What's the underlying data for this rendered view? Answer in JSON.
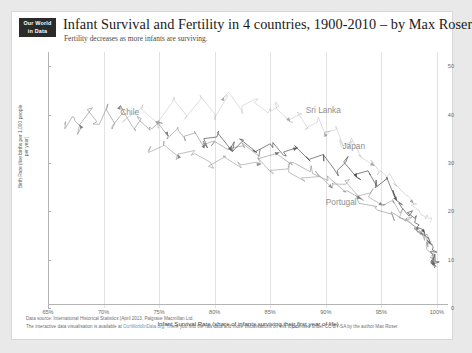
{
  "header": {
    "logo_line1": "Our World",
    "logo_line2": "in Data",
    "title": "Infant Survival and Fertility in 4 countries, 1900-2010 – by Max Roser",
    "subtitle": "Fertility decreases as more infants are surviving."
  },
  "footer": {
    "source": "Data source:  International Historical Statistics (April 2013, Palgrave Macmillan Ltd.",
    "interactive_pre": "The interactive data visualisation is available at ",
    "interactive_link": "OurWorldInData.org",
    "interactive_post": ". There you find the raw data and more visualisations on this topic.",
    "license": "Licensed under CC-BY-SA by the author Max Roser"
  },
  "chart_data": {
    "type": "line",
    "title": "Infant Survival and Fertility in 4 countries, 1900-2010",
    "subtitle": "Fertility decreases as more infants are surviving.",
    "xlabel": "Infant Survival Rate (share of infants surviving their first year of life)",
    "ylabel": "Birth Rate (live births per 1,000 people per year)",
    "xlim": [
      65,
      101
    ],
    "ylim": [
      0,
      53
    ],
    "grid": "vertical",
    "legend_position": "inline-annotations",
    "xticks": [
      "65%",
      "70%",
      "75%",
      "80%",
      "85%",
      "90%",
      "95%",
      "100%"
    ],
    "xtick_values": [
      65,
      70,
      75,
      80,
      85,
      90,
      95,
      100
    ],
    "yticks": [
      "0",
      "10",
      "20",
      "30",
      "40",
      "50"
    ],
    "ytick_values": [
      0,
      10,
      20,
      30,
      40,
      50
    ],
    "annotations": [
      {
        "text": "Chile",
        "x": 71.5,
        "y": 40.5
      },
      {
        "text": "Sri Lanka",
        "x": 88.2,
        "y": 41.0
      },
      {
        "text": "Japan",
        "x": 91.5,
        "y": 33.5
      },
      {
        "text": "Portugal",
        "x": 90.0,
        "y": 22.0
      }
    ],
    "series": [
      {
        "name": "Chile",
        "color": "#6e6e6e",
        "points": [
          [
            66.5,
            38.0
          ],
          [
            67.2,
            39.6
          ],
          [
            68.0,
            37.4
          ],
          [
            68.6,
            40.2
          ],
          [
            69.4,
            38.6
          ],
          [
            70.2,
            41.0
          ],
          [
            71.0,
            38.2
          ],
          [
            71.8,
            40.6
          ],
          [
            72.6,
            37.6
          ],
          [
            73.4,
            39.2
          ],
          [
            74.2,
            36.8
          ],
          [
            75.0,
            38.4
          ],
          [
            75.8,
            35.6
          ],
          [
            76.6,
            37.0
          ],
          [
            77.4,
            34.8
          ],
          [
            78.2,
            36.2
          ],
          [
            79.0,
            33.4
          ],
          [
            80.0,
            34.6
          ],
          [
            81.2,
            32.8
          ],
          [
            82.6,
            33.6
          ],
          [
            84.0,
            31.4
          ],
          [
            85.6,
            32.0
          ],
          [
            87.0,
            29.6
          ],
          [
            88.6,
            28.2
          ],
          [
            90.2,
            26.4
          ],
          [
            91.8,
            24.0
          ],
          [
            93.2,
            22.6
          ],
          [
            94.6,
            21.0
          ],
          [
            96.0,
            19.4
          ],
          [
            97.2,
            18.0
          ],
          [
            98.2,
            16.6
          ],
          [
            98.9,
            15.2
          ],
          [
            99.3,
            14.0
          ],
          [
            99.6,
            13.0
          ]
        ]
      },
      {
        "name": "Sri Lanka",
        "color": "#9a9a9a",
        "points": [
          [
            72.0,
            39.0
          ],
          [
            73.5,
            41.5
          ],
          [
            74.8,
            38.4
          ],
          [
            76.2,
            42.6
          ],
          [
            77.5,
            39.8
          ],
          [
            78.8,
            43.4
          ],
          [
            80.0,
            40.2
          ],
          [
            81.2,
            44.0
          ],
          [
            82.4,
            41.0
          ],
          [
            83.6,
            43.2
          ],
          [
            84.8,
            40.4
          ],
          [
            85.8,
            41.8
          ],
          [
            86.8,
            38.6
          ],
          [
            87.6,
            40.0
          ],
          [
            88.4,
            37.2
          ],
          [
            89.2,
            38.4
          ],
          [
            90.0,
            35.6
          ],
          [
            90.8,
            36.8
          ],
          [
            91.6,
            33.4
          ],
          [
            92.4,
            34.6
          ],
          [
            93.2,
            31.2
          ],
          [
            94.0,
            30.0
          ],
          [
            94.8,
            28.4
          ],
          [
            95.6,
            27.0
          ],
          [
            96.4,
            25.2
          ],
          [
            97.2,
            23.4
          ],
          [
            97.9,
            21.6
          ],
          [
            98.4,
            20.2
          ],
          [
            98.9,
            19.0
          ],
          [
            99.2,
            18.6
          ]
        ]
      },
      {
        "name": "Japan",
        "color": "#4a4a4a",
        "points": [
          [
            79.0,
            34.2
          ],
          [
            80.2,
            35.4
          ],
          [
            81.4,
            33.0
          ],
          [
            82.6,
            34.8
          ],
          [
            83.8,
            32.2
          ],
          [
            85.0,
            34.0
          ],
          [
            86.2,
            31.6
          ],
          [
            87.4,
            33.2
          ],
          [
            88.6,
            30.4
          ],
          [
            89.8,
            31.8
          ],
          [
            90.8,
            28.6
          ],
          [
            91.8,
            30.2
          ],
          [
            92.8,
            27.0
          ],
          [
            93.8,
            28.4
          ],
          [
            94.6,
            25.2
          ],
          [
            95.4,
            26.6
          ],
          [
            96.2,
            23.0
          ],
          [
            96.9,
            21.4
          ],
          [
            97.5,
            19.0
          ],
          [
            98.0,
            18.6
          ],
          [
            98.4,
            17.2
          ],
          [
            98.8,
            16.0
          ],
          [
            99.1,
            14.6
          ],
          [
            99.4,
            13.4
          ],
          [
            99.6,
            12.0
          ],
          [
            99.75,
            10.6
          ],
          [
            99.85,
            9.6
          ],
          [
            99.9,
            8.6
          ]
        ]
      },
      {
        "name": "Portugal",
        "color": "#7d7d7d",
        "points": [
          [
            74.0,
            32.4
          ],
          [
            75.4,
            33.6
          ],
          [
            76.8,
            31.2
          ],
          [
            78.2,
            32.6
          ],
          [
            79.6,
            30.2
          ],
          [
            81.0,
            31.4
          ],
          [
            82.4,
            29.0
          ],
          [
            83.8,
            30.2
          ],
          [
            85.2,
            27.8
          ],
          [
            86.6,
            28.8
          ],
          [
            88.0,
            26.4
          ],
          [
            89.4,
            27.2
          ],
          [
            90.6,
            24.8
          ],
          [
            91.8,
            25.6
          ],
          [
            93.0,
            23.0
          ],
          [
            94.0,
            23.8
          ],
          [
            95.0,
            21.4
          ],
          [
            95.9,
            22.2
          ],
          [
            96.7,
            19.6
          ],
          [
            97.4,
            18.2
          ],
          [
            98.0,
            16.8
          ],
          [
            98.5,
            15.4
          ],
          [
            98.9,
            14.0
          ],
          [
            99.2,
            12.6
          ],
          [
            99.45,
            11.4
          ],
          [
            99.65,
            10.4
          ],
          [
            99.8,
            9.8
          ]
        ]
      }
    ]
  }
}
